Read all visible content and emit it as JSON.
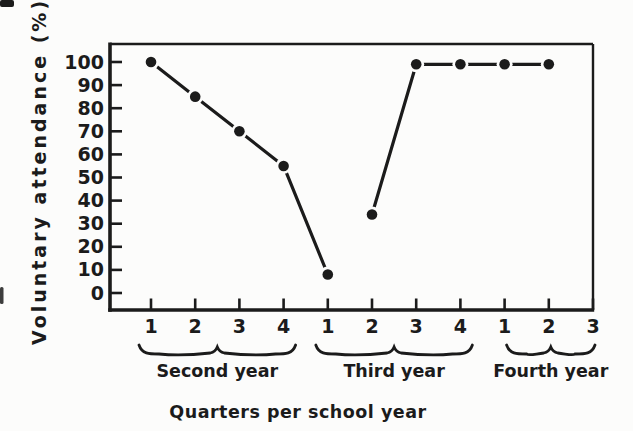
{
  "chart_data": {
    "type": "line",
    "title": "",
    "ylabel": "Voluntary attendance (%)",
    "xlabel": "Quarters per school year",
    "ylim": [
      0,
      100
    ],
    "y_ticks": [
      0,
      10,
      20,
      30,
      40,
      50,
      60,
      70,
      80,
      90,
      100
    ],
    "x_tick_labels": [
      "1",
      "2",
      "3",
      "4",
      "1",
      "2",
      "3",
      "4",
      "1",
      "2",
      "3"
    ],
    "year_groups": [
      {
        "label": "Second year",
        "first_tick": 0,
        "last_tick": 3
      },
      {
        "label": "Third year",
        "first_tick": 4,
        "last_tick": 7
      },
      {
        "label": "Fourth year",
        "first_tick": 8,
        "last_tick": 10
      }
    ],
    "series": [
      {
        "name": "Voluntary attendance",
        "marker": "filled-circle",
        "color": "#1b1b1b",
        "segments": [
          {
            "x_tick_index": [
              0,
              1,
              2,
              3,
              4
            ],
            "values": [
              100,
              85,
              70,
              55,
              8
            ]
          },
          {
            "x_tick_index": [
              5,
              6,
              7,
              8,
              9
            ],
            "values": [
              34,
              99,
              99,
              99,
              99
            ]
          }
        ]
      }
    ],
    "legend": "none",
    "grid": false
  },
  "colors": {
    "ink": "#1b1b1b",
    "background": "#fcfcfb"
  }
}
